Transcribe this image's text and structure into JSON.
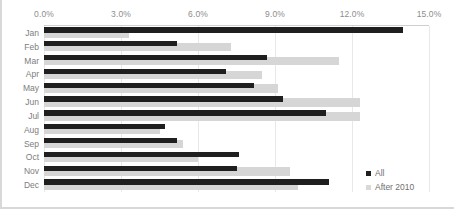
{
  "chart_data": {
    "type": "bar",
    "orientation": "horizontal",
    "title": "",
    "xlabel": "",
    "ylabel": "",
    "xlim": [
      0,
      15
    ],
    "xticks": [
      0,
      3,
      6,
      9,
      12,
      15
    ],
    "xtick_labels": [
      "0.0%",
      "3.0%",
      "6.0%",
      "9.0%",
      "12.0%",
      "15.0%"
    ],
    "categories": [
      "Jan",
      "Feb",
      "Mar",
      "Apr",
      "May",
      "Jun",
      "Jul",
      "Aug",
      "Sep",
      "Oct",
      "Nov",
      "Dec"
    ],
    "grid": true,
    "legend_position": "bottom-right",
    "series": [
      {
        "name": "All",
        "color": "#1f1f1f",
        "values": [
          14.0,
          5.2,
          8.7,
          7.1,
          8.2,
          9.3,
          11.0,
          4.7,
          5.2,
          7.6,
          7.5,
          11.1
        ]
      },
      {
        "name": "After 2010",
        "color": "#d6d6d6",
        "values": [
          3.3,
          7.3,
          11.5,
          8.5,
          9.1,
          12.3,
          12.3,
          4.5,
          5.4,
          6.0,
          9.6,
          9.9
        ]
      }
    ]
  },
  "legend": {
    "items": [
      {
        "label": "All",
        "swatch": "square-dark-icon"
      },
      {
        "label": "After 2010",
        "swatch": "square-light-icon"
      }
    ]
  }
}
